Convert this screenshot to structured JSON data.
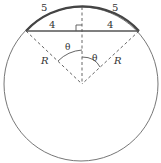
{
  "diagram": {
    "type": "circle-chord-geometry",
    "labels": {
      "arc_left": "5",
      "arc_right": "5",
      "half_chord_left": "4",
      "half_chord_right": "4",
      "angle_left": "θ",
      "angle_right": "θ",
      "radius_left": "R",
      "radius_right": "R"
    },
    "colors": {
      "stroke": "#555555",
      "arc_bold": "#444444",
      "text": "#333333",
      "background": "#ffffff"
    }
  }
}
